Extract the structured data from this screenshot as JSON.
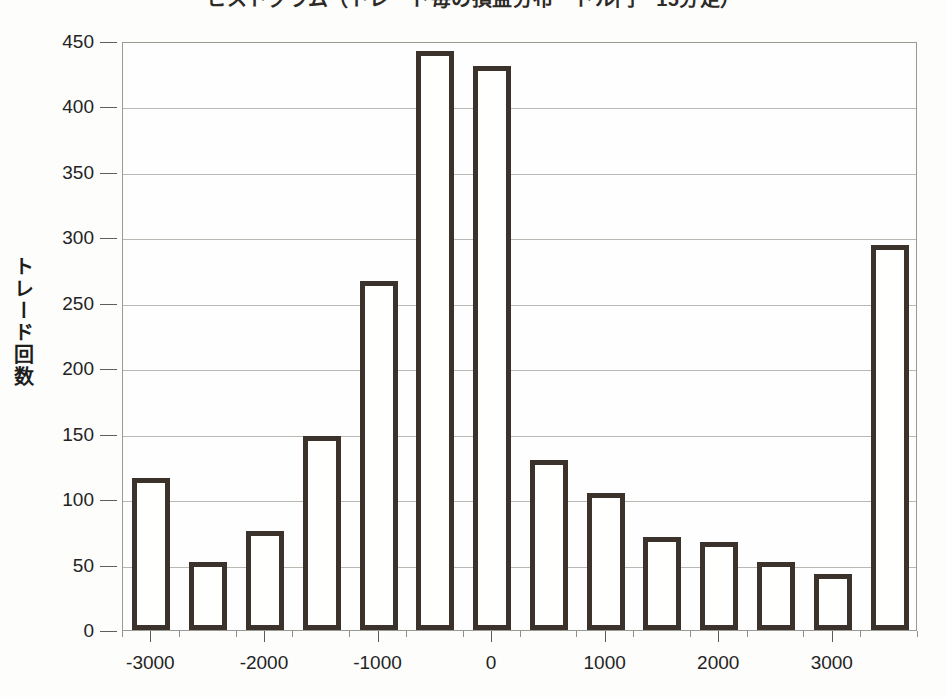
{
  "title": "ヒストグラム（トレード毎の損益分布　ドル円　15分足）",
  "chart_data": {
    "type": "bar",
    "title": "ヒストグラム（トレード毎の損益分布　ドル円　15分足）",
    "xlabel": "",
    "ylabel": "トレード回数",
    "categories": [
      -3000,
      -2500,
      -2000,
      -1500,
      -1000,
      -500,
      0,
      500,
      1000,
      1500,
      2000,
      2500,
      3000,
      3500
    ],
    "values": [
      116,
      52,
      76,
      148,
      267,
      442,
      431,
      130,
      105,
      71,
      67,
      52,
      43,
      294
    ],
    "ylim": [
      0,
      450
    ],
    "ytick_labels": [
      "0",
      "50",
      "100",
      "150",
      "200",
      "250",
      "300",
      "350",
      "400",
      "450"
    ],
    "ytick_values": [
      0,
      50,
      100,
      150,
      200,
      250,
      300,
      350,
      400,
      450
    ],
    "xtick_labels": [
      "-3000",
      "-2000",
      "-1000",
      "0",
      "1000",
      "2000",
      "3000"
    ],
    "xtick_values": [
      -3000,
      -2000,
      -1000,
      0,
      1000,
      2000,
      3000
    ],
    "xlim": [
      -3250,
      3750
    ],
    "grid": true,
    "legend": false,
    "bar_fill_color": "#fffffe",
    "bar_edge_color": "#3a322b",
    "gridline_color": "#b9b9b4",
    "axis_color": "#5a5a56",
    "background_color": "#fdfdfc"
  }
}
